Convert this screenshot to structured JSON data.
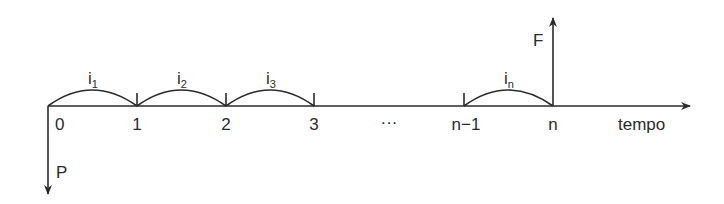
{
  "diagram": {
    "type": "cash-flow-timeline",
    "axis_label": "tempo",
    "periods": [
      {
        "label": "0",
        "x": 48
      },
      {
        "label": "1",
        "x": 137
      },
      {
        "label": "2",
        "x": 226
      },
      {
        "label": "3",
        "x": 314
      },
      {
        "label": "···",
        "x": 389
      },
      {
        "label": "n−1",
        "x": 464
      },
      {
        "label": "n",
        "x": 553
      }
    ],
    "rates": [
      {
        "base": "i",
        "sub": "1"
      },
      {
        "base": "i",
        "sub": "2"
      },
      {
        "base": "i",
        "sub": "3"
      },
      {
        "base": "i",
        "sub": "n"
      }
    ],
    "flows": {
      "outflow": {
        "label": "P",
        "at": "0",
        "direction": "down"
      },
      "inflow": {
        "label": "F",
        "at": "n",
        "direction": "up"
      }
    },
    "colors": {
      "ink": "#2b2b2b",
      "background": "#ffffff"
    }
  }
}
